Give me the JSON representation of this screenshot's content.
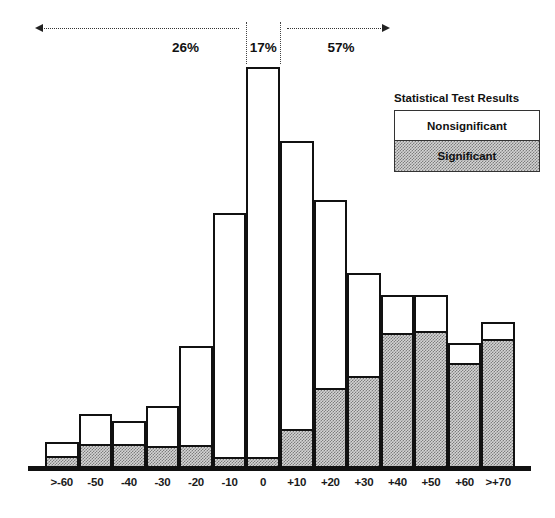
{
  "chart_data": {
    "type": "bar",
    "title": "",
    "xlabel": "",
    "ylabel": "",
    "stacked": true,
    "grid": false,
    "legend_position": "top-right",
    "baseline_y_px": 468,
    "plot_top_y_px": 60,
    "bar_left_px": 45,
    "bar_right_px": 515,
    "categories": [
      ">-60",
      "-50",
      "-40",
      "-30",
      "-20",
      "-10",
      "0",
      "+10",
      "+20",
      "+30",
      "+40",
      "+50",
      "+60",
      ">+70"
    ],
    "series": [
      {
        "name": "Significant",
        "values": [
          13,
          25,
          25,
          23,
          24,
          12,
          12,
          40,
          81,
          93,
          136,
          138,
          106,
          130
        ]
      },
      {
        "name": "Nonsignificant",
        "values": [
          13,
          29,
          22,
          39,
          98,
          243,
          389,
          287,
          187,
          102,
          37,
          35,
          19,
          16
        ]
      }
    ],
    "totals": [
      26,
      54,
      47,
      62,
      122,
      255,
      401,
      327,
      268,
      195,
      173,
      173,
      125,
      146
    ],
    "ylim": [
      0,
      408
    ]
  },
  "annotations": {
    "segments": [
      {
        "id": "left-segment",
        "label": "26%",
        "from_category": ">-60",
        "to_category": "-10"
      },
      {
        "id": "center-segment",
        "label": "17%",
        "from_category": "0",
        "to_category": "0"
      },
      {
        "id": "right-segment",
        "label": "57%",
        "from_category": "+10",
        "to_category": ">+70"
      }
    ]
  },
  "legend": {
    "title": "Statistical Test Results",
    "items": [
      {
        "id": "nonsignificant",
        "label": "Nonsignificant",
        "swatch": "white"
      },
      {
        "id": "significant",
        "label": "Significant",
        "swatch": "hatched-gray"
      }
    ]
  },
  "colors": {
    "outline": "#111111",
    "nonsignificant_fill": "#ffffff",
    "significant_fill": "#d4d4d4",
    "annotation": "#333333",
    "background": "#ffffff"
  }
}
